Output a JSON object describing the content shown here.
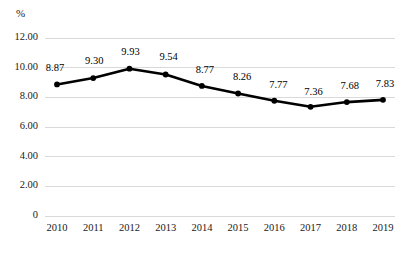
{
  "chart_data": {
    "type": "line",
    "title": "",
    "subtitle": "",
    "xlabel": "",
    "ylabel": "",
    "unit_label": "%",
    "categories": [
      "2010",
      "2011",
      "2012",
      "2013",
      "2014",
      "2015",
      "2016",
      "2017",
      "2018",
      "2019"
    ],
    "values": [
      8.87,
      9.3,
      9.93,
      9.54,
      8.77,
      8.26,
      7.77,
      7.36,
      7.68,
      7.83
    ],
    "data_labels": [
      "8.87",
      "9.30",
      "9.93",
      "9.54",
      "8.77",
      "8.26",
      "7.77",
      "7.36",
      "7.68",
      "7.83"
    ],
    "ylim": [
      0,
      12
    ],
    "yticks": [
      12,
      10,
      8,
      6,
      4,
      2,
      0
    ],
    "ytick_labels": [
      "12.00",
      "10.00",
      "8.00",
      "6.00",
      "4.00",
      "2.00",
      "0"
    ],
    "grid": true,
    "grid_axis": "y",
    "legend": "none",
    "series": [
      {
        "name": "",
        "values": [
          8.87,
          9.3,
          9.93,
          9.54,
          8.77,
          8.26,
          7.77,
          7.36,
          7.68,
          7.83
        ],
        "line_color": "#000000",
        "marker": "circle",
        "marker_color": "#000000"
      }
    ]
  },
  "style": {
    "background": "#ffffff",
    "grid_color": "#d9d9d9",
    "line_color": "#000000",
    "marker_color": "#000000",
    "text_color": "#1a1a1a"
  }
}
